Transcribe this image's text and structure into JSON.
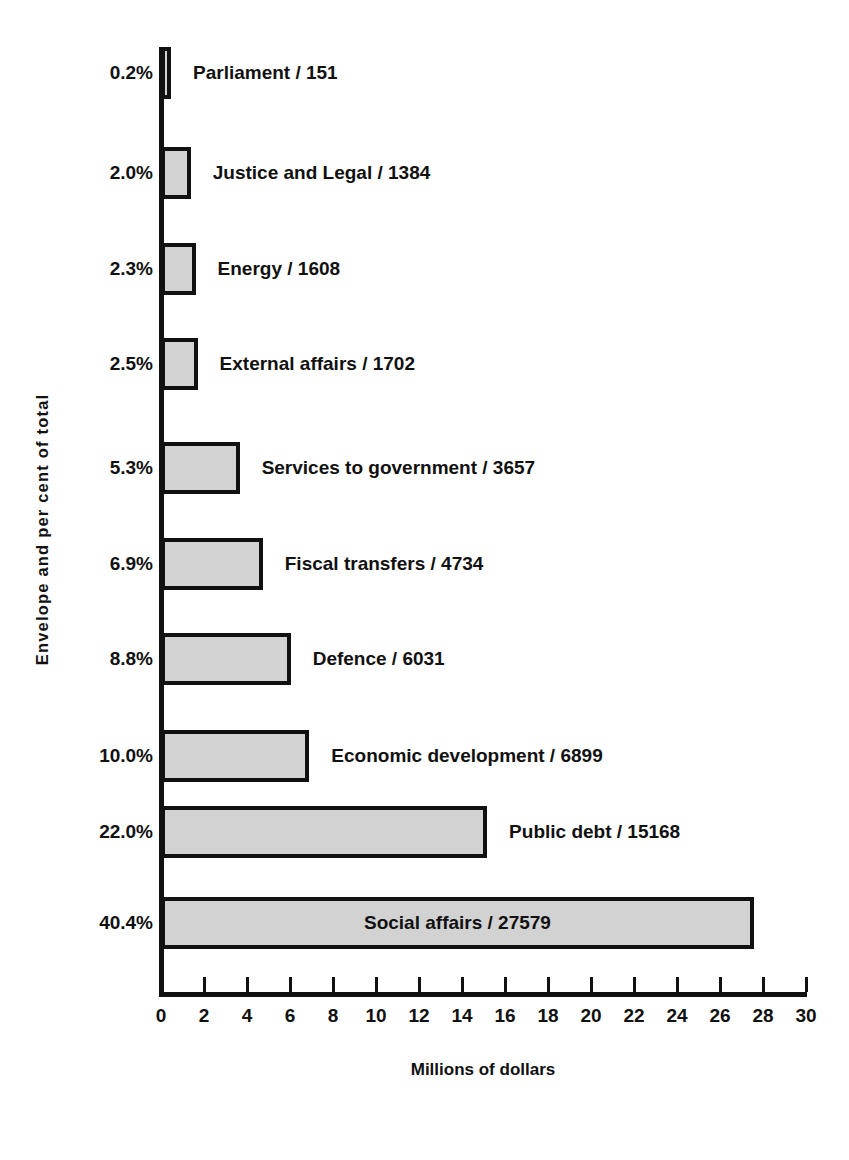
{
  "chart_data": {
    "type": "bar",
    "orientation": "horizontal",
    "title": "",
    "xlabel": "Millions of dollars",
    "ylabel": "Envelope and per cent of total",
    "xlim": [
      0,
      30
    ],
    "xticks": [
      0,
      2,
      4,
      6,
      8,
      10,
      12,
      14,
      16,
      18,
      20,
      22,
      24,
      26,
      28,
      30
    ],
    "grid": false,
    "legend": false,
    "categories": [
      "Parliament",
      "Justice and Legal",
      "Energy",
      "External affairs",
      "Services to government",
      "Fiscal transfers",
      "Defence",
      "Economic development",
      "Public debt",
      "Social affairs"
    ],
    "values": [
      151,
      1384,
      1608,
      1702,
      3657,
      4734,
      6031,
      6899,
      15168,
      27579
    ],
    "percents": [
      "0.2%",
      "2.0%",
      "2.3%",
      "2.5%",
      "5.3%",
      "6.9%",
      "8.8%",
      "10.0%",
      "22.0%",
      "40.4%"
    ],
    "bar_labels": [
      "Parliament / 151",
      "Justice and Legal / 1384",
      "Energy / 1608",
      "External affairs / 1702",
      "Services to government / 3657",
      "Fiscal transfers / 4734",
      "Defence / 6031",
      "Economic development / 6899",
      "Public debt / 15168",
      "Social affairs / 27579"
    ],
    "bar_fill_color": "#d2d2d2",
    "bar_edge_color": "#111111",
    "value_unit": "millions of dollars"
  },
  "bars": [
    {
      "pct": "0.2%",
      "label": "Parliament / 151",
      "value": 0.151,
      "top": 47,
      "label_inside": false
    },
    {
      "pct": "2.0%",
      "label": "Justice and Legal / 1384",
      "value": 1.384,
      "top": 147,
      "label_inside": false
    },
    {
      "pct": "2.3%",
      "label": "Energy / 1608",
      "value": 1.608,
      "top": 243,
      "label_inside": false
    },
    {
      "pct": "2.5%",
      "label": "External affairs / 1702",
      "value": 1.702,
      "top": 338,
      "label_inside": false
    },
    {
      "pct": "5.3%",
      "label": "Services to government / 3657",
      "value": 3.657,
      "top": 442,
      "label_inside": false
    },
    {
      "pct": "6.9%",
      "label": "Fiscal transfers / 4734",
      "value": 4.734,
      "top": 538,
      "label_inside": false
    },
    {
      "pct": "8.8%",
      "label": "Defence / 6031",
      "value": 6.031,
      "top": 633,
      "label_inside": false
    },
    {
      "pct": "10.0%",
      "label": "Economic development / 6899",
      "value": 6.899,
      "top": 730,
      "label_inside": false
    },
    {
      "pct": "22.0%",
      "label": "Public debt / 15168",
      "value": 15.168,
      "top": 806,
      "label_inside": false
    },
    {
      "pct": "40.4%",
      "label": "Social affairs / 27579",
      "value": 27.579,
      "top": 897,
      "label_inside": true
    }
  ],
  "axis": {
    "x_title": "Millions of dollars",
    "y_title": "Envelope and per cent of total",
    "ticks": [
      "0",
      "2",
      "4",
      "6",
      "8",
      "10",
      "12",
      "14",
      "16",
      "18",
      "20",
      "22",
      "24",
      "26",
      "28",
      "30"
    ]
  }
}
